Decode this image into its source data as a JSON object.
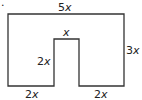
{
  "figure": {
    "marker": ".",
    "shape": "rectangle with rectangular notch cut from bottom center",
    "stroke_color": "#333333",
    "labels": {
      "top": {
        "coef": "5",
        "var": "x"
      },
      "right": {
        "coef": "3",
        "var": "x"
      },
      "notch_top": {
        "coef": "",
        "var": "x"
      },
      "notch_side": {
        "coef": "2",
        "var": "x"
      },
      "bottom_left": {
        "coef": "2",
        "var": "x"
      },
      "bottom_right": {
        "coef": "2",
        "var": "x"
      }
    }
  }
}
